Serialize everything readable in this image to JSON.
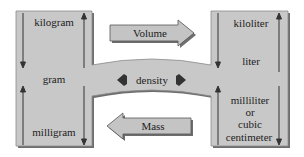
{
  "diagram": {
    "type": "unit-conversion-flow",
    "colors": {
      "box_fill": "#c8c8c8",
      "box_shadow": "#6e6e6e",
      "arrow_fill": "#bdbdbd",
      "line": "#333333",
      "background": "#ffffff"
    },
    "mass_units": {
      "top": "kilogram",
      "middle": "gram",
      "bottom": "milligram"
    },
    "volume_units": {
      "top": "kiloliter",
      "middle": "liter",
      "bottom_line1": "milliliter",
      "bottom_line2": "or",
      "bottom_line3": "cubic",
      "bottom_line4": "centimeter"
    },
    "arrows": {
      "to_volume": "Volume",
      "to_mass": "Mass",
      "bridge": "density"
    }
  }
}
